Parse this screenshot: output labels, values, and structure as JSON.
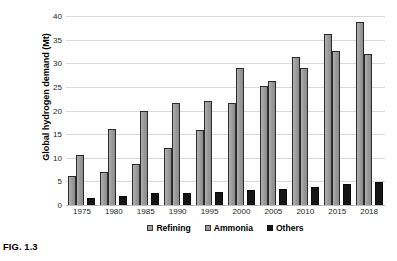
{
  "caption": "FIG. 1.3",
  "legend": {
    "items": [
      {
        "label": "Refining",
        "color": "#9d9d9d",
        "key": "refining"
      },
      {
        "label": "Ammonia",
        "color": "#9a9a9a",
        "key": "ammonia"
      },
      {
        "label": "Others",
        "color": "#141414",
        "key": "others"
      }
    ]
  },
  "chart_data": {
    "type": "bar",
    "title": "",
    "xlabel": "",
    "ylabel": "Global hydrogen demand (Mt)",
    "ylim": [
      0,
      40
    ],
    "yticks": [
      0,
      5,
      10,
      15,
      20,
      25,
      30,
      35,
      40
    ],
    "ytick_labels": [
      "0",
      "5",
      "10",
      "15",
      "20",
      "25",
      "30",
      "35",
      "40"
    ],
    "grid": true,
    "legend_position": "bottom",
    "categories": [
      "1975",
      "1980",
      "1985",
      "1990",
      "1995",
      "2000",
      "2005",
      "2010",
      "2015",
      "2018"
    ],
    "series": [
      {
        "name": "Refining",
        "color": "#9d9d9d",
        "values": [
          6.2,
          6.9,
          8.7,
          12.0,
          15.8,
          21.5,
          25.2,
          31.3,
          36.2,
          38.8
        ]
      },
      {
        "name": "Ammonia",
        "color": "#9a9a9a",
        "values": [
          10.6,
          16.1,
          20.0,
          21.5,
          22.1,
          29.0,
          26.3,
          29.0,
          32.5,
          32.0
        ]
      },
      {
        "name": "Others",
        "color": "#141414",
        "values": [
          1.5,
          2.0,
          2.5,
          2.6,
          2.8,
          3.2,
          3.4,
          3.8,
          4.4,
          4.8
        ]
      }
    ]
  }
}
